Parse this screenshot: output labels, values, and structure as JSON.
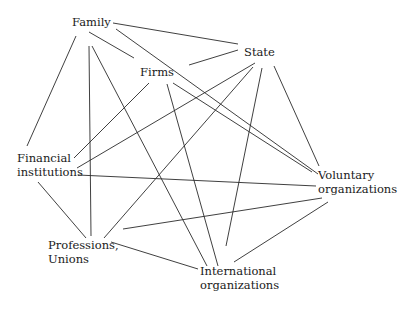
{
  "diagram": {
    "type": "network",
    "nodes": [
      {
        "id": "family",
        "label_lines": [
          "Family"
        ],
        "x": 72,
        "y": 15
      },
      {
        "id": "state",
        "label_lines": [
          "State"
        ],
        "x": 244,
        "y": 45
      },
      {
        "id": "firms",
        "label_lines": [
          "Firms"
        ],
        "x": 140,
        "y": 65
      },
      {
        "id": "financial",
        "label_lines": [
          "Financial",
          "institutions"
        ],
        "x": 17,
        "y": 151
      },
      {
        "id": "voluntary",
        "label_lines": [
          "Voluntary",
          "organizations"
        ],
        "x": 318,
        "y": 168
      },
      {
        "id": "professions",
        "label_lines": [
          "Professions,",
          "Unions"
        ],
        "x": 48,
        "y": 238
      },
      {
        "id": "international",
        "label_lines": [
          "International",
          "organizations"
        ],
        "x": 200,
        "y": 264
      }
    ],
    "edges": [
      {
        "from": "family",
        "to": "state",
        "x1": 113,
        "y1": 23,
        "x2": 238,
        "y2": 44
      },
      {
        "from": "family",
        "to": "voluntary",
        "x1": 116,
        "y1": 29,
        "x2": 318,
        "y2": 174
      },
      {
        "from": "family",
        "to": "firms",
        "x1": 89,
        "y1": 32,
        "x2": 134,
        "y2": 58
      },
      {
        "from": "family",
        "to": "financial",
        "x1": 76,
        "y1": 36,
        "x2": 27,
        "y2": 146
      },
      {
        "from": "family",
        "to": "professions",
        "x1": 89,
        "y1": 46,
        "x2": 91,
        "y2": 236
      },
      {
        "from": "family",
        "to": "international",
        "x1": 92,
        "y1": 46,
        "x2": 207,
        "y2": 266
      },
      {
        "from": "firms",
        "to": "state",
        "x1": 189,
        "y1": 65,
        "x2": 238,
        "y2": 50
      },
      {
        "from": "firms",
        "to": "financial",
        "x1": 149,
        "y1": 83,
        "x2": 74,
        "y2": 158
      },
      {
        "from": "firms",
        "to": "international",
        "x1": 167,
        "y1": 84,
        "x2": 218,
        "y2": 266
      },
      {
        "from": "firms",
        "to": "voluntary",
        "x1": 173,
        "y1": 83,
        "x2": 312,
        "y2": 172
      },
      {
        "from": "state",
        "to": "financial",
        "x1": 255,
        "y1": 63,
        "x2": 77,
        "y2": 168
      },
      {
        "from": "state",
        "to": "professions",
        "x1": 253,
        "y1": 67,
        "x2": 104,
        "y2": 238
      },
      {
        "from": "state",
        "to": "international",
        "x1": 262,
        "y1": 68,
        "x2": 226,
        "y2": 246
      },
      {
        "from": "state",
        "to": "voluntary",
        "x1": 274,
        "y1": 66,
        "x2": 319,
        "y2": 166
      },
      {
        "from": "financial",
        "to": "voluntary",
        "x1": 78,
        "y1": 175,
        "x2": 316,
        "y2": 186
      },
      {
        "from": "financial",
        "to": "professions",
        "x1": 38,
        "y1": 182,
        "x2": 86,
        "y2": 238
      },
      {
        "from": "professions",
        "to": "voluntary",
        "x1": 123,
        "y1": 229,
        "x2": 322,
        "y2": 198
      },
      {
        "from": "professions",
        "to": "international",
        "x1": 111,
        "y1": 242,
        "x2": 198,
        "y2": 269
      },
      {
        "from": "international",
        "to": "voluntary",
        "x1": 234,
        "y1": 262,
        "x2": 328,
        "y2": 202
      }
    ],
    "colors": {
      "background": "#ffffff",
      "line": "#2a2a2a",
      "text": "#1a1a1a"
    }
  }
}
